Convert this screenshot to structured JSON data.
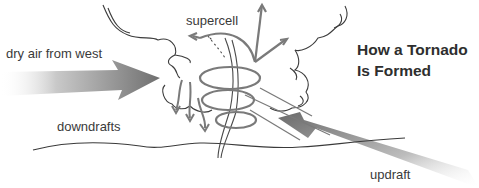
{
  "diagram": {
    "title_line1": "How a Tornado",
    "title_line2": "Is Formed",
    "labels": {
      "supercell": "supercell",
      "dry_air": "dry air from west",
      "downdrafts": "downdrafts",
      "updraft": "updraft"
    },
    "colors": {
      "arrow_gray": "#7a7a7a",
      "line_dark": "#4a4a4a",
      "text": "#3a3a3a"
    }
  }
}
